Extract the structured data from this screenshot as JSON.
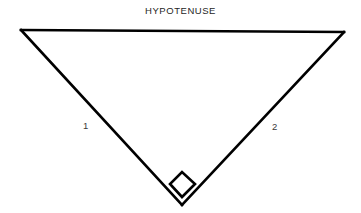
{
  "figure": {
    "kind": "right-triangle-diagram",
    "width": 361,
    "height": 213,
    "background_color": "#ffffff",
    "stroke_color": "#000000",
    "stroke_width": 2.6
  },
  "labels": {
    "hypotenuse": "HYPOTENUSE",
    "leg_left": "1",
    "leg_right": "2"
  },
  "geometry": {
    "vertices": {
      "top_left": {
        "x": 21,
        "y": 30
      },
      "top_right": {
        "x": 344,
        "y": 32
      },
      "bottom": {
        "x": 182,
        "y": 205
      }
    },
    "right_angle_marker": {
      "shape": "rotated-square",
      "vertex": {
        "x": 182,
        "y": 205
      },
      "points": [
        {
          "x": 182,
          "y": 197
        },
        {
          "x": 170,
          "y": 184
        },
        {
          "x": 182,
          "y": 172
        },
        {
          "x": 195,
          "y": 184
        }
      ]
    },
    "edges": [
      {
        "name": "hypotenuse",
        "from": "top_left",
        "to": "top_right"
      },
      {
        "name": "leg_left",
        "from": "top_left",
        "to": "bottom"
      },
      {
        "name": "leg_right",
        "from": "top_right",
        "to": "bottom"
      }
    ]
  }
}
